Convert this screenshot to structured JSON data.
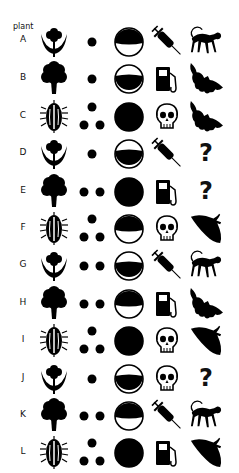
{
  "header": {
    "label": "plant"
  },
  "columns": [
    "plant-type",
    "dot-count",
    "circle-fill",
    "object",
    "animal"
  ],
  "rows": [
    {
      "label": "A",
      "plant": "flower-moon",
      "dots": 1,
      "circle": "top",
      "object": "syringe",
      "animal": "monkey"
    },
    {
      "label": "B",
      "plant": "tree",
      "dots": 1,
      "circle": "bottom",
      "object": "fuel-pump",
      "animal": "bat"
    },
    {
      "label": "C",
      "plant": "beetle",
      "dots": 3,
      "circle": "full",
      "object": "skull",
      "animal": "bat"
    },
    {
      "label": "D",
      "plant": "flower-moon",
      "dots": 1,
      "circle": "bottom",
      "object": "syringe",
      "animal": "unknown"
    },
    {
      "label": "E",
      "plant": "tree",
      "dots": 2,
      "circle": "full",
      "object": "fuel-pump",
      "animal": "unknown"
    },
    {
      "label": "F",
      "plant": "beetle",
      "dots": 3,
      "circle": "top",
      "object": "skull",
      "animal": "moth"
    },
    {
      "label": "G",
      "plant": "flower-moon",
      "dots": 2,
      "circle": "bottom",
      "object": "syringe",
      "animal": "monkey"
    },
    {
      "label": "H",
      "plant": "tree",
      "dots": 2,
      "circle": "top",
      "object": "fuel-pump",
      "animal": "bat"
    },
    {
      "label": "I",
      "plant": "beetle",
      "dots": 3,
      "circle": "full",
      "object": "skull",
      "animal": "moth"
    },
    {
      "label": "J",
      "plant": "flower-moon",
      "dots": 1,
      "circle": "bottom",
      "object": "skull",
      "animal": "unknown"
    },
    {
      "label": "K",
      "plant": "tree",
      "dots": 2,
      "circle": "top",
      "object": "syringe",
      "animal": "monkey"
    },
    {
      "label": "L",
      "plant": "beetle",
      "dots": 3,
      "circle": "full",
      "object": "fuel-pump",
      "animal": "moth"
    }
  ],
  "unknown_symbol": "?"
}
